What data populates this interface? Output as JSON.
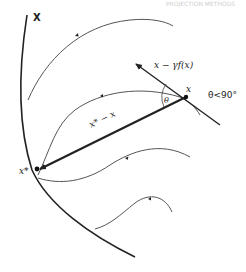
{
  "diagram": {
    "header_text": "PROJECTION METHODS",
    "labels": {
      "set": "X",
      "optimum": "x*",
      "point": "x",
      "direction_to_opt": "x* − x",
      "gradient_step": "x − γf(x)",
      "angle": "θ",
      "angle_condition": "θ<90°"
    },
    "colors": {
      "stroke": "#222222",
      "trajectory": "#555555",
      "background": "#ffffff"
    }
  }
}
